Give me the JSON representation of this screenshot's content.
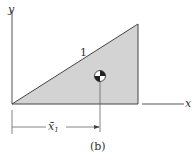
{
  "figure": {
    "caption": "(b)",
    "axis_x_label": "x",
    "axis_y_label": "y",
    "edge_label": "1",
    "dimension_label": "x̄",
    "dimension_subscript": "1",
    "fill_color": "#d3d3d3",
    "line_color": "#444444"
  }
}
